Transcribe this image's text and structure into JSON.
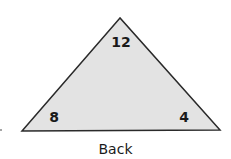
{
  "card": {
    "shape": "triangle",
    "side_label": "Back",
    "numbers": {
      "top": "12",
      "bottom_left": "8",
      "bottom_right": "4"
    },
    "colors": {
      "fill": "#e3e3e3",
      "stroke": "#2a2a2a"
    }
  }
}
